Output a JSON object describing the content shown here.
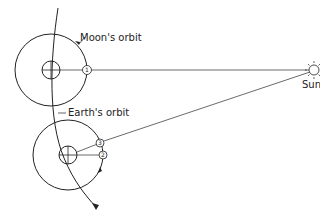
{
  "labels": {
    "moon_orbit": "Moon's orbit",
    "earth_orbit": "Earth's orbit",
    "sun": "Sun"
  },
  "moon_positions": [
    "1",
    "2",
    "3"
  ]
}
